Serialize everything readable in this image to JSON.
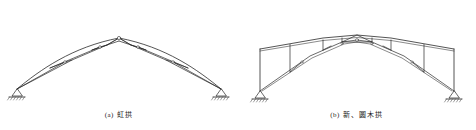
{
  "page": {
    "background_color": "#ffffff",
    "line_color": "#2a2a2a",
    "width": 476,
    "height": 130
  },
  "figures": [
    {
      "id": "figure-a",
      "caption_index": "(a)",
      "caption_text": "虹拱",
      "structure_type": "lenticular-arch-truss",
      "support_type": "pinned",
      "support_count": 2
    },
    {
      "id": "figure-b",
      "caption_index": "(b)",
      "caption_text": "新、圆木拱",
      "structure_type": "polygonal-arch-truss",
      "support_type": "pinned",
      "support_count": 2
    }
  ]
}
